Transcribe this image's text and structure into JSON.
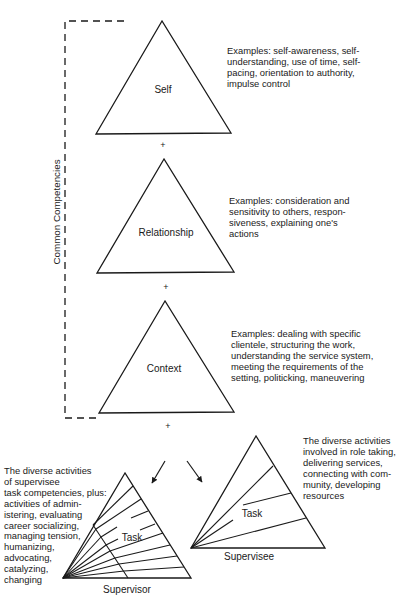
{
  "diagram": {
    "side_label": "Common Competencies",
    "plus_sign": "+",
    "triangles": {
      "self": {
        "label": "Self",
        "examples": [
          "Examples: self-awareness, self-",
          "understanding, use of time, self-",
          "pacing, orientation to authority,",
          "impulse control"
        ]
      },
      "relationship": {
        "label": "Relationship",
        "examples": [
          "Examples: consideration and",
          "sensitivity to others, respon-",
          "siveness, explaining one's",
          "actions"
        ]
      },
      "context": {
        "label": "Context",
        "examples": [
          "Examples: dealing with specific",
          "clientele, structuring the work,",
          "understanding the service system,",
          "meeting the requirements of the",
          "setting, politicking, maneuvering"
        ]
      },
      "supervisor": {
        "inner_label": "Task",
        "caption": "Supervisor",
        "description": [
          "The diverse activities",
          "of supervisee",
          "task competencies, plus:",
          "activities of admin-",
          "istering, evaluating",
          "career socializing,",
          "managing tension,",
          "humanizing,",
          "advocating,",
          "catalyzing,",
          "changing"
        ]
      },
      "supervisee": {
        "inner_label": "Task",
        "caption": "Supervisee",
        "description": [
          "The diverse activities",
          "involved in role taking,",
          "delivering services,",
          "connecting with com-",
          "munity, developing",
          "resources"
        ]
      }
    }
  }
}
